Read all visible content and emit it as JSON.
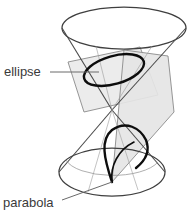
{
  "figure": {
    "kind": "conic-sections-double-cone-diagram",
    "width": 191,
    "height": 222,
    "background_color": "#ffffff",
    "stroke_color": "#4a4a4a",
    "heavy_stroke_color": "#111111",
    "plane_fill_color": "#e9e9e9",
    "plane_fill_color_dark": "#dedede",
    "plane_edge_color": "#7a7a7a",
    "leader_color": "#6a6a6a"
  },
  "labels": {
    "ellipse": {
      "text": "ellipse",
      "x": 4,
      "y": 76,
      "leader_from_x": 50,
      "leader_from_y": 72,
      "leader_to_x": 99,
      "leader_to_y": 72
    },
    "parabola": {
      "text": "parabola",
      "x": 3,
      "y": 207,
      "leader_from_x": 62,
      "leader_from_y": 200,
      "leader_to_x": 112,
      "leader_to_y": 182
    }
  },
  "geometry": {
    "top_rim": {
      "cx": 124,
      "cy": 28,
      "rx": 62,
      "ry": 21
    },
    "bottom_rim": {
      "cx": 112,
      "cy": 172,
      "rx": 53,
      "ry": 24
    },
    "apex": {
      "x": 112,
      "y": 110
    },
    "ellipse_section": {
      "cx": 114,
      "cy": 70,
      "rx": 31,
      "ry": 14,
      "rotation": -16
    },
    "cutting_plane_ellipse": [
      [
        68,
        62
      ],
      [
        140,
        47
      ],
      [
        158,
        95
      ],
      [
        84,
        112
      ]
    ],
    "cutting_plane_parabola": [
      [
        120,
        52
      ],
      [
        166,
        58
      ],
      [
        172,
        110
      ],
      [
        112,
        182
      ]
    ]
  },
  "parts": [
    {
      "name": "upper-cone",
      "role": "surface"
    },
    {
      "name": "lower-cone",
      "role": "surface"
    },
    {
      "name": "ellipse-cross-section",
      "role": "conic-curve"
    },
    {
      "name": "parabola-cross-section",
      "role": "conic-curve"
    },
    {
      "name": "cutting-plane-1",
      "role": "plane"
    },
    {
      "name": "cutting-plane-2",
      "role": "plane"
    }
  ]
}
